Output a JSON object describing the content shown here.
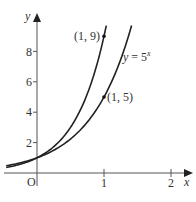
{
  "diagram": {
    "type": "function-graph",
    "axes": {
      "x_label": "x",
      "y_label": "y",
      "origin_label": "O",
      "x_ticks": [
        {
          "value": 1,
          "label": "1"
        },
        {
          "value": 2,
          "label": "2"
        }
      ],
      "y_ticks": [
        {
          "value": 2,
          "label": "2"
        },
        {
          "value": 4,
          "label": "4"
        },
        {
          "value": 6,
          "label": "6"
        },
        {
          "value": 8,
          "label": "8"
        }
      ]
    },
    "curves": [
      {
        "name": "curve-9x",
        "base": 9,
        "label": ""
      },
      {
        "name": "curve-5x",
        "base": 5,
        "label_prefix": "y = 5",
        "label_exp": "x"
      }
    ],
    "points": [
      {
        "label": "(1, 9)",
        "x": 1,
        "y": 9
      },
      {
        "label": "(1, 5)",
        "x": 1,
        "y": 5
      }
    ],
    "colors": {
      "curve": "#222222",
      "axis": "#555555",
      "text": "#333333"
    }
  }
}
